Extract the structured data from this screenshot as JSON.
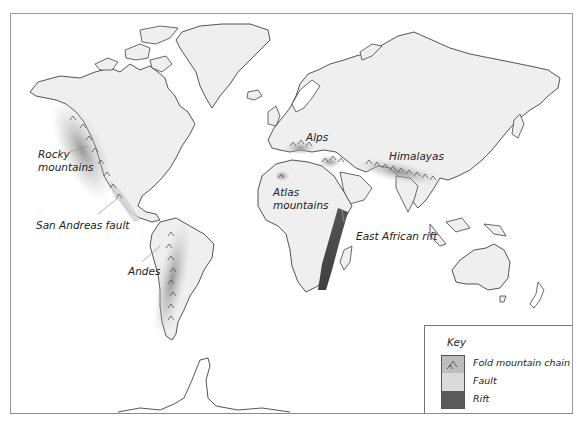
{
  "map": {
    "title": "World fold mountains, faults and rifts",
    "colors": {
      "land": "#efefef",
      "coast": "#2a2a2a",
      "fold": "#9a9a9a",
      "fault": "#d8d8d8",
      "rift": "#4a4a4a"
    },
    "labels": [
      {
        "id": "rocky",
        "text": "Rocky\nmountains"
      },
      {
        "id": "san-andreas",
        "text": "San Andreas fault"
      },
      {
        "id": "andes",
        "text": "Andes"
      },
      {
        "id": "alps",
        "text": "Alps"
      },
      {
        "id": "atlas",
        "text": "Atlas\nmountains"
      },
      {
        "id": "himalayas",
        "text": "Himalayas"
      },
      {
        "id": "east-african-rift",
        "text": "East African rift"
      }
    ]
  },
  "labels": {
    "rocky_1": "Rocky",
    "rocky_2": "mountains",
    "san_andreas": "San Andreas fault",
    "andes": "Andes",
    "alps": "Alps",
    "atlas_1": "Atlas",
    "atlas_2": "mountains",
    "himalayas": "Himalayas",
    "east_african_rift": "East African rift"
  },
  "legend": {
    "title": "Key",
    "items": [
      {
        "label": "Fold mountain chain",
        "icon": "fold-mountain-icon"
      },
      {
        "label": "Fault",
        "icon": "fault-swatch"
      },
      {
        "label": "Rift",
        "icon": "rift-swatch"
      }
    ]
  }
}
